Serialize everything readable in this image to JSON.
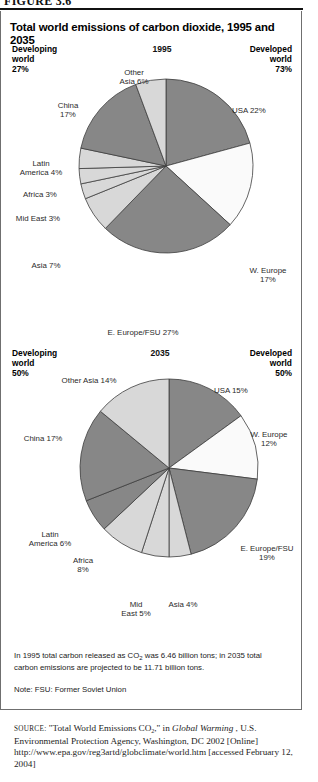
{
  "figure": {
    "caption": "FIGURE 3.6",
    "title": "Total world emissions of carbon dioxide, 1995 and 2035"
  },
  "charts": [
    {
      "id": "chart-1995",
      "year_label": "1995",
      "developing_note": "Developing\nworld\n27%",
      "developed_note": "Developed\nworld\n73%"
    },
    {
      "id": "chart-2035",
      "year_label": "2035",
      "developing_note": "Developing\nworld\n50%",
      "developed_note": "Developed\nworld\n50%"
    }
  ],
  "labels_1995": {
    "usa": "USA 22%",
    "w_europe": "W. Europe\n17%",
    "e_europe": "E. Europe/FSU 27%",
    "asia": "Asia 7%",
    "mid_east": "Mid East 3%",
    "africa": "Africa 3%",
    "latin_america": "Latin\nAmerica 4%",
    "china": "China\n17%",
    "other_asia": "Other\nAsia 6%"
  },
  "labels_2035": {
    "usa": "USA 15%",
    "w_europe": "W. Europe\n12%",
    "e_europe": "E. Europe/FSU\n19%",
    "asia": "Asia 4%",
    "mid_east": "Mid\nEast 5%",
    "africa": "Africa\n8%",
    "latin_america": "Latin\nAmerica 6%",
    "china": "China 17%",
    "other_asia": "Other Asia 14%"
  },
  "notes": {
    "totals_pre": "In 1995 total carbon released as CO",
    "totals_sub": "2",
    "totals_post": " was 6.46 billion tons; in 2035 total carbon emissions are projected to be 11.71 billion tons.",
    "fsu": "Note: FSU: Former Soviet Union"
  },
  "source": {
    "label": "source:",
    "part1": " \"Total World Emissions CO",
    "sub": "2",
    "part2": ",\" in ",
    "italic_title": "Global Warming",
    "part3": " , U.S. Environmental Protection Agency, Washington, DC 2002 [Online] http://www.epa.gov/reg3artd/globclimate/world.htm [accessed February 12, 2004]"
  },
  "colors": {
    "dark_slice": "#878787",
    "light_slice": "#d8d8d8",
    "white_slice": "#fafafa",
    "slice_stroke": "#3d3d3d",
    "frame": "#6f6f6f",
    "text": "#1a1a1a"
  },
  "chart_data": [
    {
      "type": "pie",
      "title": "1995",
      "categories": [
        "USA",
        "W. Europe",
        "E. Europe/FSU",
        "Asia",
        "Mid East",
        "Africa",
        "Latin America",
        "China",
        "Other Asia"
      ],
      "values": [
        22,
        17,
        27,
        7,
        3,
        3,
        4,
        17,
        6
      ],
      "unit": "percent",
      "shades": [
        "dark",
        "white",
        "dark",
        "light",
        "light",
        "light",
        "light",
        "dark",
        "light"
      ],
      "start_angle_deg": 0,
      "direction": "clockwise",
      "legend": "none",
      "annotations": [
        "Developing world 27%",
        "Developed world 73%"
      ]
    },
    {
      "type": "pie",
      "title": "2035",
      "categories": [
        "USA",
        "W. Europe",
        "E. Europe/FSU",
        "Asia",
        "Mid East",
        "Africa",
        "Latin America",
        "China",
        "Other Asia"
      ],
      "values": [
        15,
        12,
        19,
        4,
        5,
        8,
        6,
        17,
        14
      ],
      "unit": "percent",
      "shades": [
        "dark",
        "white",
        "dark",
        "light",
        "light",
        "light",
        "dark",
        "dark",
        "light"
      ],
      "start_angle_deg": 0,
      "direction": "clockwise",
      "legend": "none",
      "annotations": [
        "Developing world 50%",
        "Developed world 50%"
      ]
    }
  ]
}
